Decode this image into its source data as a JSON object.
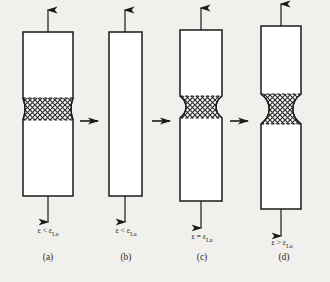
{
  "figure": {
    "background_color": "#f2f0ec",
    "stroke_color": "#1a1a1a",
    "hatch_color": "#2b2b2b",
    "specimen_fill": "#ffffff",
    "hatch_fill": "#b9b9b9"
  },
  "symbols": {
    "epsilon": "ε",
    "less_than": "<",
    "greater_than": ">",
    "equals": "=",
    "subscript_lu": "Lu",
    "up_arrow_icon": "up-arrow-icon",
    "down_arrow_icon": "down-arrow-icon",
    "right_arrow_icon": "right-arrow-icon"
  },
  "panels": [
    {
      "id": "a",
      "letter": "(a)",
      "strain_symbol": "ε",
      "relation": "<",
      "strain_ref_symbol": "ε",
      "strain_ref_sub": "Lu",
      "strain_expression": "ε < εLu",
      "description": "Uniform bar with a wide diffuse necking band",
      "bar_width": 50,
      "bar_height": 185,
      "neck_width": 44,
      "neck_top": 86,
      "neck_bottom": 127,
      "hatched": true
    },
    {
      "id": "b",
      "letter": "(b)",
      "strain_symbol": "ε",
      "relation": "<",
      "strain_ref_symbol": "ε",
      "strain_ref_sub": "Lu",
      "strain_expression": "ε < εLu",
      "description": "Uniform bar, no visible neck",
      "bar_width": 33,
      "bar_height": 185,
      "neck_width": 33,
      "neck_top": 0,
      "neck_bottom": 0,
      "hatched": false
    },
    {
      "id": "c",
      "letter": "(c)",
      "strain_symbol": "ε",
      "relation": "=",
      "strain_ref_symbol": "ε",
      "strain_ref_sub": "Lu",
      "strain_expression": "ε = εLu",
      "description": "Bar with a localized hatched neck at onset",
      "bar_width": 42,
      "bar_height": 192,
      "neck_width": 29,
      "neck_top": 84,
      "neck_bottom": 122,
      "hatched": true
    },
    {
      "id": "d",
      "letter": "(d)",
      "strain_symbol": "ε",
      "relation": ">",
      "strain_ref_symbol": "ε",
      "strain_ref_sub": "Lu",
      "strain_expression": "ε > εLu",
      "description": "Elongated bar with a pronounced hatched neck",
      "bar_width": 40,
      "bar_height": 205,
      "neck_width": 27,
      "neck_top": 84,
      "neck_bottom": 128,
      "hatched": true
    }
  ],
  "step_arrows": [
    {
      "id": "arrow-a-b",
      "icon": "right-arrow-icon"
    },
    {
      "id": "arrow-b-c",
      "icon": "right-arrow-icon"
    },
    {
      "id": "arrow-c-d",
      "icon": "right-arrow-icon"
    }
  ]
}
